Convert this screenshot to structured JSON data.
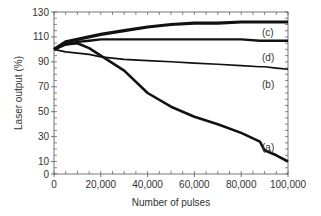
{
  "chart_data": {
    "type": "line",
    "title": "",
    "xlabel": "Number of pulses",
    "ylabel": "Laser output (%)",
    "xlim": [
      0,
      100000
    ],
    "ylim": [
      0,
      130
    ],
    "x_ticks": [
      0,
      20000,
      40000,
      60000,
      80000,
      100000
    ],
    "x_tick_labels": [
      "0",
      "20,000",
      "40,000",
      "60,000",
      "80,000",
      "100,000"
    ],
    "y_ticks": [
      0,
      10,
      30,
      50,
      70,
      90,
      110,
      130
    ],
    "y_tick_labels": [
      "0",
      "10",
      "30",
      "50",
      "70",
      "90",
      "110",
      "130"
    ],
    "grid": false,
    "legend": "inline labels at right end of curves",
    "x": [
      0,
      5000,
      10000,
      15000,
      20000,
      30000,
      40000,
      50000,
      60000,
      70000,
      80000,
      88000,
      90000,
      95000,
      100000
    ],
    "series": [
      {
        "name": "(a)",
        "label": "(a)",
        "values": [
          100,
          104,
          105,
          101,
          95,
          83,
          65,
          54,
          46,
          40,
          33,
          26,
          19,
          15,
          10
        ]
      },
      {
        "name": "(b)",
        "label": "(b)",
        "values": [
          100,
          98,
          97,
          96,
          94,
          92,
          91,
          90,
          89,
          88,
          87,
          86,
          86,
          85,
          84
        ]
      },
      {
        "name": "(c)",
        "label": "(c)",
        "values": [
          100,
          106,
          108,
          110,
          112,
          115,
          118,
          120,
          121,
          121,
          122,
          122,
          122,
          122,
          122
        ]
      },
      {
        "name": "(d)",
        "label": "(d)",
        "values": [
          100,
          104,
          106,
          107,
          108,
          108,
          108,
          108,
          108,
          108,
          108,
          107,
          107,
          107,
          107
        ]
      }
    ],
    "line_color": "#111111"
  }
}
